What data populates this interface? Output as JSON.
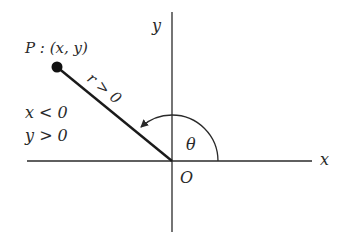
{
  "diagram": {
    "type": "polar-coordinate-angle-diagram",
    "axes": {
      "x_label": "x",
      "y_label": "y",
      "origin_label": "O"
    },
    "point": {
      "label": "P : (x, y)",
      "name": "P",
      "coords": "(x, y)"
    },
    "radius_label": "r > 0",
    "angle_label": "θ",
    "conditions": {
      "x_condition": "x < 0",
      "y_condition": "y > 0"
    },
    "colors": {
      "stroke": "#2a2a2a",
      "background": "#ffffff"
    }
  }
}
